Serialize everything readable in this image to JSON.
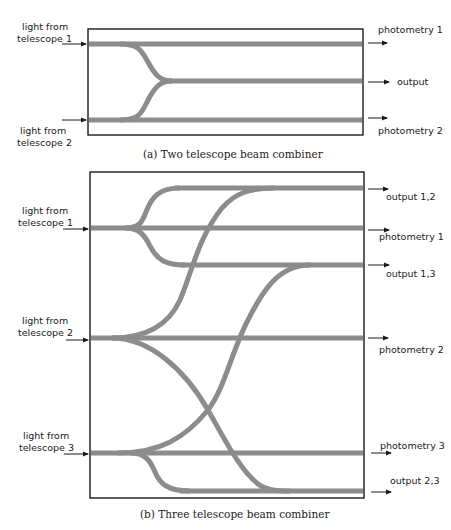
{
  "colors": {
    "waveguide": "#8c8c8c",
    "frame": "#1a1a1a",
    "text": "#1a1a1a"
  },
  "diagram_a": {
    "caption": "(a) Two telescope beam combiner",
    "inputs": [
      {
        "line1": "light from",
        "line2": "telescope 1"
      },
      {
        "line1": "light from",
        "line2": "telescope 2"
      }
    ],
    "outputs": [
      {
        "label": "photometry 1"
      },
      {
        "label": "output"
      },
      {
        "label": "photometry 2"
      }
    ]
  },
  "diagram_b": {
    "caption": "(b) Three telescope beam combiner",
    "inputs": [
      {
        "line1": "light from",
        "line2": "telescope 1"
      },
      {
        "line1": "light from",
        "line2": "telescope 2"
      },
      {
        "line1": "light from",
        "line2": "telescope 3"
      }
    ],
    "outputs": [
      {
        "label": "output 1,2"
      },
      {
        "label": "photometry 1"
      },
      {
        "label": "output 1,3"
      },
      {
        "label": "photometry 2"
      },
      {
        "label": "photometry 3"
      },
      {
        "label": "output 2,3"
      }
    ]
  }
}
